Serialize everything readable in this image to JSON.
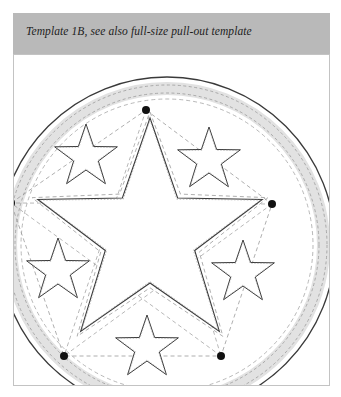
{
  "document": {
    "type": "craft-template-plate",
    "page_width": 341,
    "page_height": 397,
    "background_color": "#ffffff"
  },
  "caption": {
    "text": "Template 1B, see also full-size pull-out template",
    "bar_color": "#b9b9b9",
    "text_color": "#1d1d1d",
    "style": "italic-serif"
  },
  "plate": {
    "border_color": "#c3c3c3",
    "background_color": "#ffffff",
    "label": "template-drawing-plate"
  },
  "colors": {
    "solid_line": "#3a3a3a",
    "dashed_guide": "#9a9a9a",
    "ring_band": "#e2e2e2",
    "dot": "#111111",
    "caption_bar": "#b9b9b9",
    "plate_border": "#c3c3c3"
  },
  "drawing": {
    "name": "five-pointed-star-medallion-template",
    "circle": {
      "center_x": 167,
      "center_y": 245,
      "outer_radius": 168,
      "band_outer_radius": 163,
      "band_inner_radius": 150,
      "inner_dashed_radius": 146,
      "stroke_color": "#3a3a3a",
      "band_fill": "#e2e2e2"
    },
    "center_star": {
      "name": "center-large-star",
      "center_x": 150,
      "center_y": 236,
      "outer_radius": 118,
      "inner_radius": 47,
      "rotation_deg": -90
    },
    "satellite_stars": [
      {
        "name": "star-upper-left",
        "center_x": 86,
        "center_y": 157,
        "outer_radius": 33,
        "inner_radius": 13,
        "rotation_deg": -90
      },
      {
        "name": "star-upper-right",
        "center_x": 209,
        "center_y": 160,
        "outer_radius": 33,
        "inner_radius": 13,
        "rotation_deg": -90
      },
      {
        "name": "star-left",
        "center_x": 58,
        "center_y": 271,
        "outer_radius": 33,
        "inner_radius": 13,
        "rotation_deg": -90
      },
      {
        "name": "star-right",
        "center_x": 243,
        "center_y": 273,
        "outer_radius": 33,
        "inner_radius": 13,
        "rotation_deg": -90
      },
      {
        "name": "star-bottom",
        "center_x": 147,
        "center_y": 348,
        "outer_radius": 33,
        "inner_radius": 13,
        "rotation_deg": -90
      }
    ],
    "registration_dots": [
      {
        "name": "dot-top",
        "x": 146,
        "y": 110,
        "radius": 4
      },
      {
        "name": "dot-left",
        "x": 11,
        "y": 203,
        "radius": 4
      },
      {
        "name": "dot-right",
        "x": 272,
        "y": 204,
        "radius": 4
      },
      {
        "name": "dot-bottom-left",
        "x": 64,
        "y": 356,
        "radius": 4
      },
      {
        "name": "dot-bottom-right",
        "x": 221,
        "y": 356,
        "radius": 4
      }
    ],
    "guide_polygon": {
      "name": "dashed-construction-pentagon",
      "points": "146,110 272,204 221,356 64,356 11,203",
      "stroke_color": "#9a9a9a",
      "dash": "4 3"
    }
  }
}
